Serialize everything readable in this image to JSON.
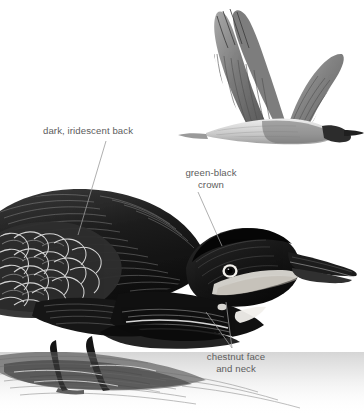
{
  "plate": {
    "background_color": "#ffffff",
    "width": 364,
    "height": 415,
    "ink_color": "#1a1a1a",
    "label_color": "#5d5d5d",
    "leader_color": "#9a9a9a"
  },
  "annotations": [
    {
      "id": "dark-iridescent-back",
      "text": "dark, iridescent back",
      "x": 43,
      "y": 125
    },
    {
      "id": "green-black-crown",
      "text": "green-black\ncrown",
      "x": 168,
      "y": 167
    },
    {
      "id": "chestnut-face-and-neck",
      "text": "chestnut face\nand neck",
      "x": 182,
      "y": 351
    }
  ],
  "figures": {
    "flying_bird": {
      "name": "heron-in-flight",
      "position": "upper-right"
    },
    "wading_bird": {
      "name": "heron-crouching-in-water",
      "position": "lower-left"
    },
    "water": {
      "name": "water-surface-with-reflection",
      "position": "bottom"
    }
  }
}
